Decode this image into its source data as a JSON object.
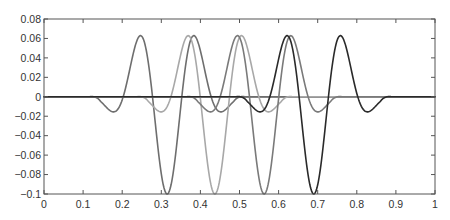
{
  "chart_data": {
    "type": "line",
    "title": "",
    "xlabel": "",
    "ylabel": "",
    "xlim": [
      0,
      1
    ],
    "ylim": [
      -0.1,
      0.08
    ],
    "grid": false,
    "legend": null,
    "x_ticks": [
      0,
      0.1,
      0.2,
      0.3,
      0.4,
      0.5,
      0.6,
      0.7,
      0.8,
      0.9,
      1
    ],
    "x_tick_labels": [
      "0",
      "0.1",
      "0.2",
      "0.3",
      "0.4",
      "0.5",
      "0.6",
      "0.7",
      "0.8",
      "0.9",
      "1"
    ],
    "y_ticks": [
      0.08,
      0.06,
      0.04,
      0.02,
      0,
      -0.02,
      -0.04,
      -0.06,
      -0.08,
      -0.1
    ],
    "y_tick_labels": [
      "0.08",
      "0.06",
      "0.04",
      "0.02",
      "0",
      "−0.02",
      "−0.04",
      "−0.06",
      "−0.08",
      "−0.1"
    ],
    "wavelet_shape": {
      "description": "translated wavelets: central trough -0.1, side peaks +0.06 at ±0.075, small outer dips ≈ -0.012 at ±0.15, support ±0.2",
      "amplitude": -0.1,
      "omega": 41.9,
      "sigma_sq": 0.011,
      "half_support": 0.2
    },
    "series": [
      {
        "name": "wavelet-1",
        "center": 0.315,
        "color": "#6e6e6e",
        "key_points": {
          "outer_dip_left": [
            0.155,
            -0.012
          ],
          "peak_left": [
            0.24,
            0.06
          ],
          "trough": [
            0.315,
            -0.1
          ],
          "peak_right": [
            0.39,
            0.06
          ],
          "outer_dip_right": [
            0.465,
            -0.012
          ]
        }
      },
      {
        "name": "wavelet-2",
        "center": 0.437,
        "color": "#a8a8a8",
        "key_points": {
          "outer_dip_left": [
            0.287,
            -0.012
          ],
          "peak_left": [
            0.362,
            0.06
          ],
          "trough": [
            0.437,
            -0.1
          ],
          "peak_right": [
            0.512,
            0.06
          ],
          "outer_dip_right": [
            0.587,
            -0.012
          ]
        }
      },
      {
        "name": "wavelet-3",
        "center": 0.563,
        "color": "#7a7a7a",
        "key_points": {
          "outer_dip_left": [
            0.413,
            -0.012
          ],
          "peak_left": [
            0.488,
            0.06
          ],
          "trough": [
            0.563,
            -0.1
          ],
          "peak_right": [
            0.638,
            0.06
          ],
          "outer_dip_right": [
            0.713,
            -0.012
          ]
        }
      },
      {
        "name": "wavelet-4",
        "center": 0.69,
        "color": "#2a2a2a",
        "key_points": {
          "outer_dip_left": [
            0.54,
            -0.012
          ],
          "peak_left": [
            0.615,
            0.06
          ],
          "trough": [
            0.69,
            -0.1
          ],
          "peak_right": [
            0.765,
            0.06
          ],
          "outer_dip_right": [
            0.84,
            -0.012
          ]
        }
      }
    ],
    "baseline": {
      "y": 0,
      "color": "#333333"
    }
  },
  "layout": {
    "plot_left": 44,
    "plot_right": 435,
    "plot_top": 19,
    "plot_bottom": 194
  }
}
